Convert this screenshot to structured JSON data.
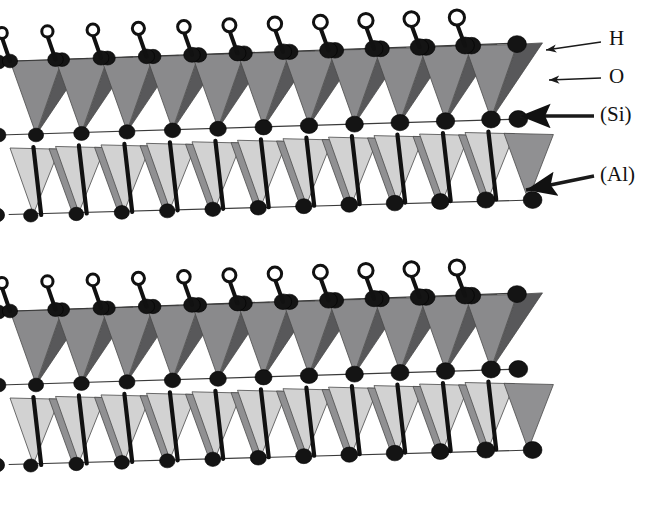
{
  "figure": {
    "background_color": "#ffffff",
    "width": 661,
    "height": 511
  },
  "labels": [
    {
      "id": "label-h",
      "text": "H",
      "text_x": 609,
      "text_y": 40,
      "leader": {
        "x1": 601,
        "y1": 42,
        "x2": 546,
        "y2": 50
      },
      "arrow_at": "end",
      "arrow_style": "thin",
      "description": "hydrogen atom, open circle"
    },
    {
      "id": "label-o",
      "text": "O",
      "text_x": 609,
      "text_y": 78,
      "leader": {
        "x1": 601,
        "y1": 78,
        "x2": 549,
        "y2": 80
      },
      "arrow_at": "end",
      "arrow_style": "thin",
      "description": "oxygen atom, filled black circle"
    },
    {
      "id": "label-si",
      "text": "(Si)",
      "text_x": 600,
      "text_y": 116,
      "leader": {
        "x1": 594,
        "y1": 116,
        "x2": 520,
        "y2": 116
      },
      "arrow_at": "end",
      "arrow_style": "thick",
      "description": "silicon tetrahedron, dark gray"
    },
    {
      "id": "label-al",
      "text": "(Al)",
      "text_x": 600,
      "text_y": 176,
      "leader": {
        "x1": 594,
        "y1": 176,
        "x2": 526,
        "y2": 190
      },
      "arrow_at": "end",
      "arrow_style": "thick",
      "description": "aluminium octahedron, medium gray"
    }
  ],
  "colors": {
    "tetra_dark": "#58585a",
    "tetra_mid": "#8a8a8c",
    "octa_light": "#d2d2d2",
    "octa_mid": "#909092",
    "atom_oxygen": "#141414",
    "atom_hydrogen_fill": "#ffffff",
    "atom_hydrogen_stroke": "#111111",
    "bond": "#3a3a3a",
    "text": "#111111"
  },
  "structure": {
    "slab_count": 2,
    "slabs": [
      {
        "id": "slab-top",
        "origin_x": 36,
        "origin_y": 60
      },
      {
        "id": "slab-bottom",
        "origin_x": 36,
        "origin_y": 310
      }
    ],
    "repeat_units": 11,
    "unit_pitch_x": 45.5,
    "perspective_rise": -1.55,
    "tetra_half_width": 26,
    "tetra_height": 74,
    "octa_height": 66,
    "octa_offset_y": 14,
    "hydroxyl_count_per_slab": 11,
    "hydroxyl_stem_length": 27,
    "hydroxyl_radius_start": 5.4,
    "hydroxyl_radius_end": 7.6,
    "oxygen_radius_start": 7.6,
    "oxygen_radius_end": 9.4,
    "sheet_sequence": [
      "tetrahedral (Si)",
      "octahedral (Al)"
    ]
  }
}
